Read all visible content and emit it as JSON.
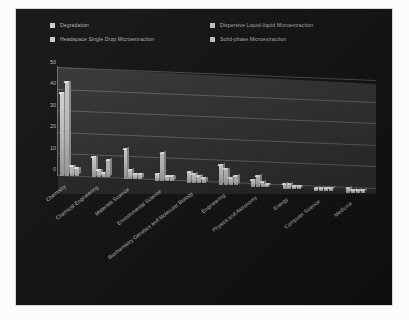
{
  "panel": {
    "background_color": "#131313",
    "page_background_color": "#fcfcfc"
  },
  "legend": {
    "position": "top",
    "swatch_color": "#cfcfcf",
    "items": [
      {
        "label": "Degradation",
        "color": "#d9d9d9"
      },
      {
        "label": "Dispersive Liquid-liquid Microextraction",
        "color": "#cccccc"
      },
      {
        "label": "Headspace Single Drop Microextraction",
        "color": "#c2c2c2"
      },
      {
        "label": "Solid-phase Microextraction",
        "color": "#bcbcbc"
      }
    ]
  },
  "axis": {
    "y_ticks": [
      "50",
      "40",
      "30",
      "20",
      "10",
      "0"
    ],
    "y_min": 0,
    "y_max": 50,
    "y_step": 10
  },
  "chart_data": {
    "type": "bar",
    "title": "",
    "subtitle": "",
    "xlabel": "",
    "ylabel": "",
    "ylim": [
      0,
      50
    ],
    "grid": true,
    "legend_position": "top",
    "orientation": "vertical-3d-grouped",
    "categories": [
      "Chemistry",
      "Chemical Engineering",
      "Materials Science",
      "Environmental Science",
      "Biochemistry Genetics and Molecular Biology",
      "Engineering",
      "Physics and Astronomy",
      "Energy",
      "Computer Science",
      "Medicine"
    ],
    "series": [
      {
        "name": "Degradation",
        "color": "#d9d9d9",
        "values": [
          38,
          9,
          14,
          3,
          5,
          9,
          3,
          2,
          1,
          2
        ]
      },
      {
        "name": "Dispersive Liquid-liquid Microextraction",
        "color": "#cccccc",
        "values": [
          43,
          3,
          4,
          13,
          4,
          7,
          5,
          2,
          1,
          1
        ]
      },
      {
        "name": "Headspace Single Drop Microextraction",
        "color": "#c2c2c2",
        "values": [
          4,
          2,
          2,
          2,
          3,
          3,
          2,
          1,
          1,
          1
        ]
      },
      {
        "name": "Solid-phase Microextraction",
        "color": "#bcbcbc",
        "values": [
          3,
          8,
          2,
          2,
          2,
          4,
          1,
          1,
          1,
          1
        ]
      }
    ]
  }
}
